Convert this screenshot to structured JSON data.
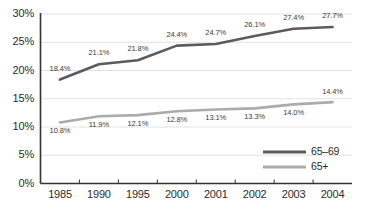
{
  "chart_data": {
    "type": "line",
    "title": "",
    "subtitle": "",
    "xlabel": "",
    "ylabel": "",
    "categories": [
      "1985",
      "1990",
      "1995",
      "2000",
      "2001",
      "2002",
      "2003",
      "2004"
    ],
    "ylim": [
      0,
      30
    ],
    "yticks": [
      "0%",
      "5%",
      "10%",
      "15%",
      "20%",
      "25%",
      "30%"
    ],
    "ytick_values": [
      0,
      5,
      10,
      15,
      20,
      25,
      30
    ],
    "grid": "horizontal",
    "legend_position": "bottom-right",
    "series": [
      {
        "name": "65–69",
        "color": "#5b5b5b",
        "values": [
          18.4,
          21.1,
          21.8,
          24.4,
          24.7,
          26.1,
          27.4,
          27.7
        ],
        "labels": [
          "18.4%",
          "21.1%",
          "21.8%",
          "24.4%",
          "24.7%",
          "26.1%",
          "27.4%",
          "27.7%"
        ]
      },
      {
        "name": "65+",
        "color": "#ababab",
        "values": [
          10.8,
          11.9,
          12.1,
          12.8,
          13.1,
          13.3,
          14.0,
          14.4
        ],
        "labels": [
          "10.8%",
          "11.9%",
          "12.1%",
          "12.8%",
          "13.1%",
          "13.3%",
          "14.0%",
          "14.4%"
        ]
      }
    ]
  },
  "legend": {
    "items": [
      {
        "label": "65–69",
        "color": "#5b5b5b"
      },
      {
        "label": "65+",
        "color": "#ababab"
      }
    ]
  },
  "axes": {
    "axis_color": "#333333",
    "grid_color": "#e2e2e2"
  }
}
